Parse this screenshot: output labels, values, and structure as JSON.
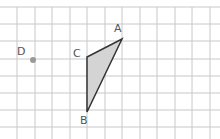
{
  "diagram": {
    "type": "grid-geometry",
    "grid": {
      "x_lines": [
        17,
        35,
        52,
        70,
        87,
        105,
        122,
        140,
        157,
        175,
        192,
        210
      ],
      "y_lines": [
        7,
        24,
        41,
        59,
        76,
        93,
        110,
        127
      ],
      "color": "#c8c8c8"
    },
    "triangle": {
      "vertices": [
        "A",
        "B",
        "C"
      ],
      "fill": "#d4d4d4",
      "stroke": "#333333"
    },
    "points": [
      {
        "id": "A",
        "label": "A",
        "x": 122,
        "y": 39,
        "label_x": 114,
        "label_y": 23
      },
      {
        "id": "B",
        "label": "B",
        "x": 87,
        "y": 112,
        "label_x": 80,
        "label_y": 115
      },
      {
        "id": "C",
        "label": "C",
        "x": 87,
        "y": 57,
        "label_x": 73,
        "label_y": 48
      },
      {
        "id": "D",
        "label": "D",
        "x": 33,
        "y": 60,
        "label_x": 17,
        "label_y": 46,
        "color": "#999999"
      }
    ]
  }
}
